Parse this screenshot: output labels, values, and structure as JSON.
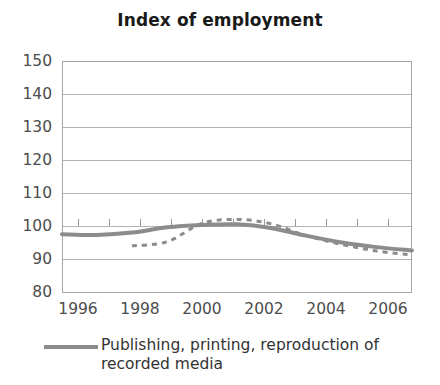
{
  "chart_data": {
    "type": "line",
    "title": "Index of employment",
    "xlabel": "",
    "ylabel": "",
    "xlim": [
      1996,
      2006
    ],
    "ylim": [
      80,
      150
    ],
    "yticks": [
      80,
      90,
      100,
      110,
      120,
      130,
      140,
      150
    ],
    "ytick_labels": [
      "80",
      "90",
      "100",
      "110",
      "120",
      "130",
      "140",
      "150"
    ],
    "xticks": [
      1996,
      1997,
      1998,
      1999,
      2000,
      2001,
      2002,
      2003,
      2004,
      2005,
      2006
    ],
    "xtick_labels": [
      "1996",
      "",
      "1998",
      "",
      "2000",
      "",
      "2002",
      "",
      "2004",
      "",
      "2006"
    ],
    "xtick_labels_shown": [
      "1996",
      "1998",
      "2000",
      "2002",
      "2004",
      "2006"
    ],
    "grid": true,
    "grid_axis": "y",
    "legend_position": "bottom",
    "series": [
      {
        "name": "Publishing, printing, reproduction of recorded media",
        "style": "solid",
        "color": "#8c8c8c",
        "width": 4,
        "x": [
          1996,
          1997,
          1998,
          1999,
          2000,
          2001,
          2002,
          2003,
          2004,
          2005,
          2006
        ],
        "values": [
          97.5,
          97.3,
          98.0,
          99.6,
          100.3,
          100.5,
          99.3,
          97.0,
          95.0,
          93.6,
          92.6
        ]
      },
      {
        "name": "",
        "style": "dashed",
        "color": "#8c8c8c",
        "width": 3,
        "x": [
          1998,
          1999,
          2000,
          2001,
          2002,
          2003,
          2004,
          2005,
          2006
        ],
        "values": [
          94.0,
          95.2,
          100.8,
          102.0,
          100.6,
          97.0,
          94.4,
          92.4,
          91.2
        ]
      }
    ]
  },
  "legend": {
    "entries": [
      {
        "label": "Publishing, printing, reproduction of recorded media",
        "swatch": "line-swatch"
      }
    ]
  },
  "axes": {
    "plot_left": 62,
    "plot_right": 412,
    "plot_top": 61,
    "plot_bottom": 292
  }
}
